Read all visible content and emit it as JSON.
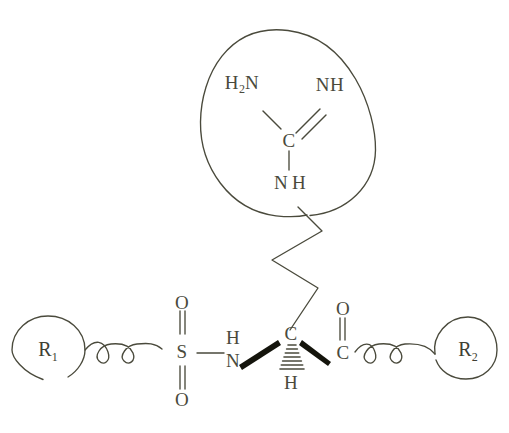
{
  "figure": {
    "kind": "chemical-structure-diagram",
    "ink_color": "#4a4a3c",
    "background_color": "#ffffff"
  },
  "guanidinium_group": {
    "enclosure": "circle",
    "amine_left": "H",
    "amine_left_sub": "2",
    "amine_left_tail": "N",
    "imine_right": "NH",
    "central_carbon": "C",
    "amine_bottom_n": "N",
    "amine_bottom_h": "H"
  },
  "backbone": {
    "substituent_left": "R",
    "substituent_left_sub": "1",
    "substituent_right": "R",
    "substituent_right_sub": "2",
    "sulfur": "S",
    "sulfonyl_oxygen_top": "O",
    "sulfonyl_oxygen_bottom": "O",
    "amide_nitrogen": "N",
    "amide_nitrogen_h": "H",
    "stereocenter_carbon": "C",
    "stereocenter_h": "H",
    "carbonyl_carbon": "C",
    "carbonyl_oxygen": "O"
  }
}
